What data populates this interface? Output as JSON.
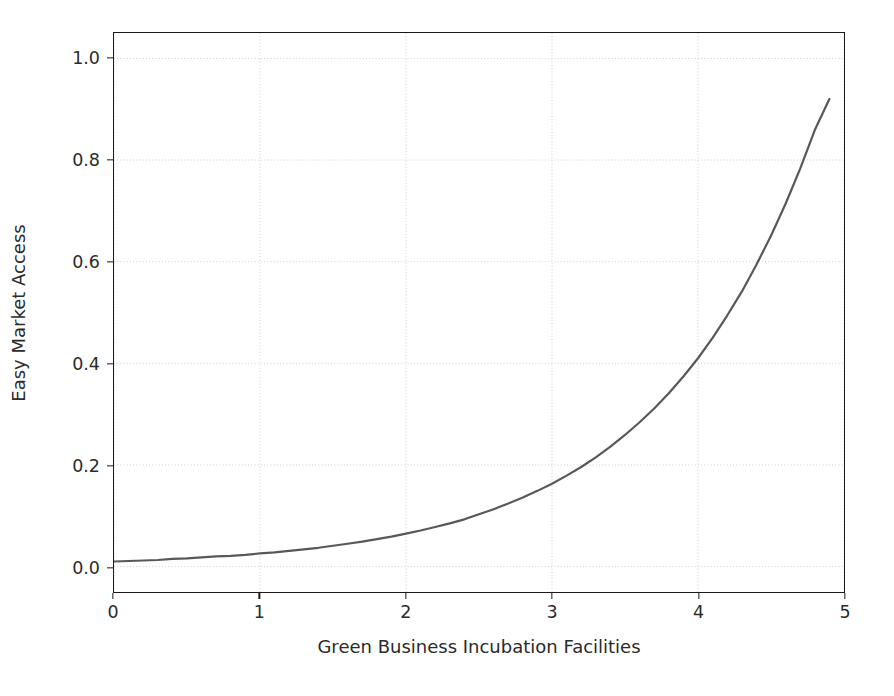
{
  "chart_data": {
    "type": "line",
    "title": "",
    "subtitle": "",
    "xlabel": "Green Business Incubation Facilities",
    "ylabel": "Easy Market Access",
    "xlim": [
      0,
      5
    ],
    "ylim": [
      -0.05,
      1.05
    ],
    "xticks": [
      0,
      1,
      2,
      3,
      4,
      5
    ],
    "xtick_labels": [
      "0",
      "1",
      "2",
      "3",
      "4",
      "5"
    ],
    "yticks": [
      0.0,
      0.2,
      0.4,
      0.6,
      0.8,
      1.0
    ],
    "ytick_labels": [
      "0.0",
      "0.2",
      "0.4",
      "0.6",
      "0.8",
      "1.0"
    ],
    "grid": true,
    "grid_style": "dotted",
    "grid_color": "#cfcfcf",
    "legend": null,
    "legend_position": "none",
    "series": [
      {
        "name": "Easy Market Access",
        "color": "#585858",
        "linewidth": 2.2,
        "x": [
          0.0,
          0.1,
          0.2,
          0.3,
          0.4,
          0.5,
          0.6,
          0.7,
          0.8,
          0.9,
          1.0,
          1.1,
          1.2,
          1.3,
          1.4,
          1.5,
          1.6,
          1.7,
          1.8,
          1.9,
          2.0,
          2.1,
          2.2,
          2.3,
          2.4,
          2.5,
          2.6,
          2.7,
          2.8,
          2.9,
          3.0,
          3.1,
          3.2,
          3.3,
          3.4,
          3.5,
          3.6,
          3.7,
          3.8,
          3.9,
          4.0,
          4.1,
          4.2,
          4.3,
          4.4,
          4.5,
          4.6,
          4.7,
          4.8,
          4.9
        ],
        "y": [
          0.01,
          0.011,
          0.012,
          0.013,
          0.015,
          0.016,
          0.018,
          0.02,
          0.021,
          0.023,
          0.026,
          0.028,
          0.031,
          0.034,
          0.037,
          0.041,
          0.045,
          0.049,
          0.054,
          0.059,
          0.065,
          0.071,
          0.078,
          0.085,
          0.093,
          0.103,
          0.113,
          0.124,
          0.136,
          0.149,
          0.163,
          0.179,
          0.196,
          0.215,
          0.236,
          0.259,
          0.284,
          0.311,
          0.341,
          0.374,
          0.41,
          0.45,
          0.494,
          0.541,
          0.594,
          0.651,
          0.714,
          0.783,
          0.859,
          0.92
        ]
      }
    ]
  },
  "axes": {
    "spine_color": "#1a1a1a",
    "tick_color": "#1a1a1a",
    "background": "#ffffff"
  }
}
